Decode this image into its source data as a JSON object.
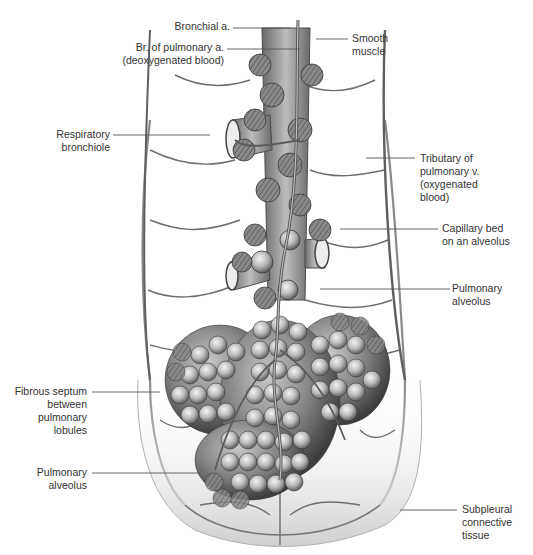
{
  "figure": {
    "colors": {
      "background": "#ffffff",
      "tissue_light": "#e6e6e6",
      "tissue_mid": "#a8a8a8",
      "tissue_dark": "#5a5a5a",
      "vessel": "#6e6e6e",
      "leader_line": "#555555",
      "text": "#333333"
    }
  },
  "labels": {
    "left": [
      {
        "id": "bronchial-artery",
        "lines": [
          "Bronchial a."
        ]
      },
      {
        "id": "pulmonary-artery-branch",
        "lines": [
          "Br. of pulmonary a.",
          "(deoxygenated blood)"
        ]
      },
      {
        "id": "respiratory-bronchiole",
        "lines": [
          "Respiratory",
          "bronchiole"
        ]
      },
      {
        "id": "fibrous-septum",
        "lines": [
          "Fibrous septum",
          "between",
          "pulmonary",
          "lobules"
        ]
      },
      {
        "id": "pulmonary-alveolus-lower",
        "lines": [
          "Pulmonary",
          "alveolus"
        ]
      }
    ],
    "right": [
      {
        "id": "smooth-muscle",
        "lines": [
          "Smooth",
          "muscle"
        ]
      },
      {
        "id": "pulmonary-vein-tributary",
        "lines": [
          "Tributary of",
          "pulmonary v.",
          "(oxygenated",
          "blood)"
        ]
      },
      {
        "id": "capillary-bed",
        "lines": [
          "Capillary bed",
          "on an alveolus"
        ]
      },
      {
        "id": "pulmonary-alveolus-upper",
        "lines": [
          "Pulmonary",
          "alveolus"
        ]
      },
      {
        "id": "subpleural-connective-tissue",
        "lines": [
          "Subpleural",
          "connective",
          "tissue"
        ]
      }
    ]
  }
}
